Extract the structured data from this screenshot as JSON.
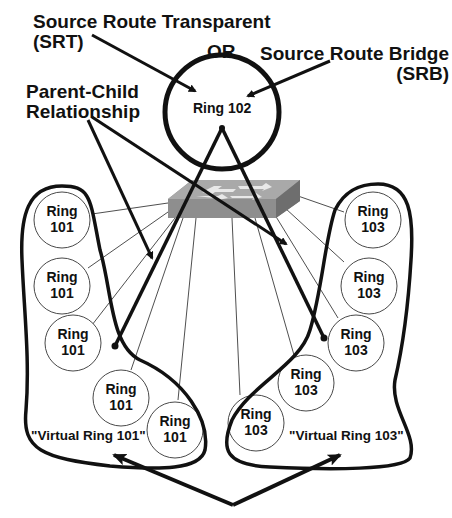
{
  "title_labels": {
    "srt_line1": "Source Route Transparent",
    "srt_line2": "(SRT)",
    "or": "OR",
    "srb_line1": "Source Route Bridge",
    "srb_line2": "(SRB)",
    "parent_child_line1": "Parent-Child",
    "parent_child_line2": "Relationship"
  },
  "parent_ring": {
    "label": "Ring 102"
  },
  "left_group": {
    "virtual_label": "\"Virtual Ring 101\"",
    "rings": [
      {
        "line1": "Ring",
        "line2": "101"
      },
      {
        "line1": "Ring",
        "line2": "101"
      },
      {
        "line1": "Ring",
        "line2": "101"
      },
      {
        "line1": "Ring",
        "line2": "101"
      },
      {
        "line1": "Ring",
        "line2": "101"
      }
    ]
  },
  "right_group": {
    "virtual_label": "\"Virtual Ring 103\"",
    "rings": [
      {
        "line1": "Ring",
        "line2": "103"
      },
      {
        "line1": "Ring",
        "line2": "103"
      },
      {
        "line1": "Ring",
        "line2": "103"
      },
      {
        "line1": "Ring",
        "line2": "103"
      },
      {
        "line1": "Ring",
        "line2": "103"
      }
    ]
  },
  "center_device": {
    "icon": "switch-icon"
  },
  "colors": {
    "ink": "#111111",
    "switch_top": "#a8a8a8",
    "switch_front": "#8c8c8c",
    "switch_side": "#6e6e6e",
    "switch_arrows": "#e6e6e6"
  }
}
